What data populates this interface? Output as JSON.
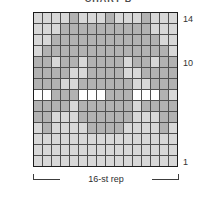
{
  "title": "CHART B",
  "labels": {
    "repeat": "16-st rep",
    "row_numbers": {
      "top": "14",
      "middle": "10",
      "bottom": "1"
    }
  },
  "colors": {
    "ground": "#d8d8d8",
    "motif": "#b2b2b2",
    "white_stitch": "#ffffff",
    "grid_line": "#4f4f4f",
    "frame": "#1c1c1c",
    "text": "#333333"
  },
  "chart_data": {
    "type": "heatmap",
    "title": "CHART B",
    "columns": 16,
    "rows": 14,
    "row_numbering": "bottom-up, rows 1-14, numbers shown for 14, 10, 1",
    "x_repeat_label": "16-st rep",
    "legend": {
      "L": "light ground stitch",
      "M": "medium gray motif stitch",
      "W": "white stitch"
    },
    "cell_colors": {
      "L": "#d8d8d8",
      "M": "#b2b2b2",
      "W": "#ffffff"
    },
    "pattern_rows_top_to_bottom": [
      "LLLLMLLLMLLLMLLL",
      "LLLMMMMMMMMMMLLL",
      "LLMMMMMMMMMMMMLL",
      "LMMMMMMMMMMMMMML",
      "MMLMMLMMMMLMMLMM",
      "MMMMLLMMMMLLMMMM",
      "MMMLLMMMMMMLLMMM",
      "WWMMMWWWMMMWWWML",
      "MMMMLMMMMMMLMMMM",
      "MMLLLMMMMMMLLLMM",
      "LMLLLLMMMMLLLLML",
      "LLLLLLLLLLLLLLLL",
      "LLLLLLLLLLLLLLLL",
      "LLLLLLLLLLLLLLLL"
    ]
  }
}
